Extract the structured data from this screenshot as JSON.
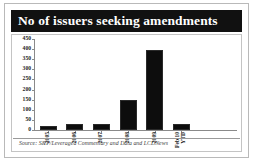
{
  "card": {
    "title": "No of issuers seeking amendments",
    "source_note": "Source: S&P/Leveraged Commentary and Data and LCDNews"
  },
  "colors": {
    "banner_background": "#111111",
    "banner_text": "#ffffff",
    "bar_fill": "#0d0d0d",
    "axis_line": "#8a8a8a",
    "card_border": "#b9b9b9",
    "plot_border": "#c4c4c4",
    "source_text": "#3d3d3d"
  },
  "chart_data": {
    "type": "bar",
    "title": "No of issuers seeking amendments",
    "xlabel": "",
    "ylabel": "",
    "categories": [
      "2005",
      "2006",
      "2007",
      "2008",
      "2009",
      "Feb 10 YTD"
    ],
    "category_lines": [
      [
        "2005"
      ],
      [
        "2006"
      ],
      [
        "2007"
      ],
      [
        "2008"
      ],
      [
        "2009"
      ],
      [
        "Feb 10",
        "YTD"
      ]
    ],
    "values": [
      22,
      28,
      30,
      148,
      395,
      30
    ],
    "ylim": [
      0,
      450
    ],
    "yticks": [
      0,
      50,
      100,
      150,
      200,
      250,
      300,
      350,
      400,
      450
    ],
    "ytick_labels": [
      "0",
      "50",
      "100",
      "150",
      "200",
      "250",
      "300",
      "350",
      "400",
      "450"
    ],
    "grid": false,
    "legend": false,
    "source": "Source: S&P/Leveraged Commentary and Data and LCDNews"
  }
}
